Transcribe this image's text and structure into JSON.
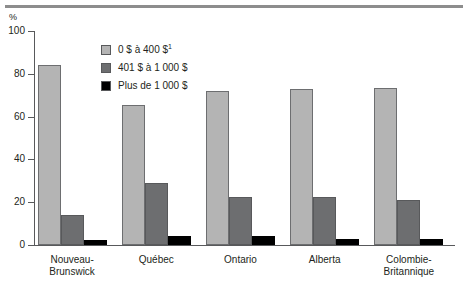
{
  "figure": {
    "axis_unit": "%",
    "has_top_rule": true
  },
  "legend": {
    "position": "inside-upper-left",
    "entries": [
      {
        "label": "0 $ à 400 $",
        "superscript": "1",
        "swatch": "light-gray-swatch",
        "color": "#b4b4b4"
      },
      {
        "label": "401 $ à 1 000 $",
        "superscript": "",
        "swatch": "medium-gray-swatch",
        "color": "#6d6e70"
      },
      {
        "label": "Plus de 1 000 $",
        "superscript": "",
        "swatch": "black-swatch",
        "color": "#000000"
      }
    ]
  },
  "chart_data": {
    "type": "bar",
    "title": "",
    "subtitle": "",
    "xlabel": "",
    "ylabel": "%",
    "ylim": [
      0,
      100
    ],
    "yticks": [
      0,
      20,
      40,
      60,
      80,
      100
    ],
    "ytick_labels": [
      "0",
      "20",
      "40",
      "60",
      "80",
      "100"
    ],
    "grid": false,
    "legend_position": "inside upper left",
    "categories": [
      "Nouveau-\nBrunswick",
      "Québec",
      "Ontario",
      "Alberta",
      "Colombie-\nBritannique"
    ],
    "category_lines": [
      [
        "Nouveau-",
        "Brunswick"
      ],
      [
        "Québec",
        ""
      ],
      [
        "Ontario",
        ""
      ],
      [
        "Alberta",
        ""
      ],
      [
        "Colombie-",
        "Britannique"
      ]
    ],
    "series": [
      {
        "name": "0 $ à 400 $",
        "color": "#b4b4b4",
        "values": [
          84,
          65.5,
          72,
          73,
          73.5
        ]
      },
      {
        "name": "401 $ à 1 000 $",
        "color": "#6d6e70",
        "values": [
          14,
          29,
          22.5,
          22.5,
          21
        ]
      },
      {
        "name": "Plus de 1 000 $",
        "color": "#000000",
        "values": [
          2.5,
          4,
          4,
          3,
          3
        ]
      }
    ]
  }
}
